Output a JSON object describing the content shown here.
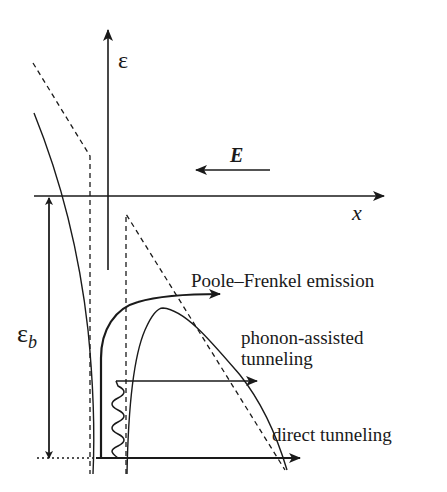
{
  "diagram": {
    "axes": {
      "energy_axis_label": "ε",
      "position_axis_label": "x"
    },
    "field_label": "E",
    "barrier_height_label": "ε",
    "barrier_height_subscript": "b",
    "mechanisms": [
      {
        "label": "Poole–Frenkel emission"
      },
      {
        "label_line1": "phonon-assisted",
        "label_line2": "tunneling"
      },
      {
        "label": "direct tunneling"
      }
    ],
    "colors": {
      "line": "#1a1a1a",
      "background": "#ffffff"
    }
  }
}
